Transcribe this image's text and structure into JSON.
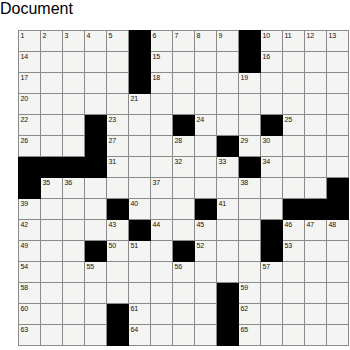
{
  "puzzle": {
    "title": "Crossword Grid",
    "rows": 15,
    "cols": 15,
    "cell_size_px": 21,
    "colors": {
      "block": "#000000",
      "cell": "#f4f4f2",
      "grid_line": "#8a8a8a",
      "number_text": "#111111",
      "page_background": "#ffffff"
    },
    "max_clue_number": 65,
    "grid": [
      [
        {
          "block": false,
          "number": "1"
        },
        {
          "block": false,
          "number": "2"
        },
        {
          "block": false,
          "number": "3"
        },
        {
          "block": false,
          "number": "4"
        },
        {
          "block": false,
          "number": "5"
        },
        {
          "block": true,
          "number": ""
        },
        {
          "block": false,
          "number": "6"
        },
        {
          "block": false,
          "number": "7"
        },
        {
          "block": false,
          "number": "8"
        },
        {
          "block": false,
          "number": "9"
        },
        {
          "block": true,
          "number": ""
        },
        {
          "block": false,
          "number": "10"
        },
        {
          "block": false,
          "number": "11"
        },
        {
          "block": false,
          "number": "12"
        },
        {
          "block": false,
          "number": "13"
        }
      ],
      [
        {
          "block": false,
          "number": "14"
        },
        {
          "block": false,
          "number": ""
        },
        {
          "block": false,
          "number": ""
        },
        {
          "block": false,
          "number": ""
        },
        {
          "block": false,
          "number": ""
        },
        {
          "block": true,
          "number": ""
        },
        {
          "block": false,
          "number": "15"
        },
        {
          "block": false,
          "number": ""
        },
        {
          "block": false,
          "number": ""
        },
        {
          "block": false,
          "number": ""
        },
        {
          "block": true,
          "number": ""
        },
        {
          "block": false,
          "number": "16"
        },
        {
          "block": false,
          "number": ""
        },
        {
          "block": false,
          "number": ""
        },
        {
          "block": false,
          "number": ""
        }
      ],
      [
        {
          "block": false,
          "number": "17"
        },
        {
          "block": false,
          "number": ""
        },
        {
          "block": false,
          "number": ""
        },
        {
          "block": false,
          "number": ""
        },
        {
          "block": false,
          "number": ""
        },
        {
          "block": true,
          "number": ""
        },
        {
          "block": false,
          "number": "18"
        },
        {
          "block": false,
          "number": ""
        },
        {
          "block": false,
          "number": ""
        },
        {
          "block": false,
          "number": ""
        },
        {
          "block": false,
          "number": "19"
        },
        {
          "block": false,
          "number": ""
        },
        {
          "block": false,
          "number": ""
        },
        {
          "block": false,
          "number": ""
        },
        {
          "block": false,
          "number": ""
        }
      ],
      [
        {
          "block": false,
          "number": "20"
        },
        {
          "block": false,
          "number": ""
        },
        {
          "block": false,
          "number": ""
        },
        {
          "block": false,
          "number": ""
        },
        {
          "block": false,
          "number": ""
        },
        {
          "block": false,
          "number": "21"
        },
        {
          "block": false,
          "number": ""
        },
        {
          "block": false,
          "number": ""
        },
        {
          "block": false,
          "number": ""
        },
        {
          "block": false,
          "number": ""
        },
        {
          "block": false,
          "number": ""
        },
        {
          "block": false,
          "number": ""
        },
        {
          "block": false,
          "number": ""
        },
        {
          "block": false,
          "number": ""
        },
        {
          "block": false,
          "number": ""
        }
      ],
      [
        {
          "block": false,
          "number": "22"
        },
        {
          "block": false,
          "number": ""
        },
        {
          "block": false,
          "number": ""
        },
        {
          "block": true,
          "number": ""
        },
        {
          "block": false,
          "number": "23"
        },
        {
          "block": false,
          "number": ""
        },
        {
          "block": false,
          "number": ""
        },
        {
          "block": true,
          "number": ""
        },
        {
          "block": false,
          "number": "24"
        },
        {
          "block": false,
          "number": ""
        },
        {
          "block": false,
          "number": ""
        },
        {
          "block": true,
          "number": ""
        },
        {
          "block": false,
          "number": "25"
        },
        {
          "block": false,
          "number": ""
        },
        {
          "block": false,
          "number": ""
        }
      ],
      [
        {
          "block": false,
          "number": "26"
        },
        {
          "block": false,
          "number": ""
        },
        {
          "block": false,
          "number": ""
        },
        {
          "block": true,
          "number": ""
        },
        {
          "block": false,
          "number": "27"
        },
        {
          "block": false,
          "number": ""
        },
        {
          "block": false,
          "number": ""
        },
        {
          "block": false,
          "number": "28"
        },
        {
          "block": false,
          "number": ""
        },
        {
          "block": true,
          "number": ""
        },
        {
          "block": false,
          "number": "29"
        },
        {
          "block": false,
          "number": "30"
        },
        {
          "block": false,
          "number": ""
        },
        {
          "block": false,
          "number": ""
        },
        {
          "block": false,
          "number": ""
        }
      ],
      [
        {
          "block": true,
          "number": ""
        },
        {
          "block": true,
          "number": ""
        },
        {
          "block": true,
          "number": ""
        },
        {
          "block": true,
          "number": ""
        },
        {
          "block": false,
          "number": "31"
        },
        {
          "block": false,
          "number": ""
        },
        {
          "block": false,
          "number": ""
        },
        {
          "block": false,
          "number": "32"
        },
        {
          "block": false,
          "number": ""
        },
        {
          "block": false,
          "number": "33"
        },
        {
          "block": true,
          "number": ""
        },
        {
          "block": false,
          "number": "34"
        },
        {
          "block": false,
          "number": ""
        },
        {
          "block": false,
          "number": ""
        },
        {
          "block": false,
          "number": ""
        }
      ],
      [
        {
          "block": true,
          "number": ""
        },
        {
          "block": false,
          "number": "35"
        },
        {
          "block": false,
          "number": "36"
        },
        {
          "block": false,
          "number": ""
        },
        {
          "block": false,
          "number": ""
        },
        {
          "block": false,
          "number": ""
        },
        {
          "block": false,
          "number": "37"
        },
        {
          "block": false,
          "number": ""
        },
        {
          "block": false,
          "number": ""
        },
        {
          "block": false,
          "number": ""
        },
        {
          "block": false,
          "number": "38"
        },
        {
          "block": false,
          "number": ""
        },
        {
          "block": false,
          "number": ""
        },
        {
          "block": false,
          "number": ""
        },
        {
          "block": true,
          "number": ""
        }
      ],
      [
        {
          "block": false,
          "number": "39"
        },
        {
          "block": false,
          "number": ""
        },
        {
          "block": false,
          "number": ""
        },
        {
          "block": false,
          "number": ""
        },
        {
          "block": true,
          "number": ""
        },
        {
          "block": false,
          "number": "40"
        },
        {
          "block": false,
          "number": ""
        },
        {
          "block": false,
          "number": ""
        },
        {
          "block": true,
          "number": ""
        },
        {
          "block": false,
          "number": "41"
        },
        {
          "block": false,
          "number": ""
        },
        {
          "block": false,
          "number": ""
        },
        {
          "block": true,
          "number": ""
        },
        {
          "block": true,
          "number": ""
        },
        {
          "block": true,
          "number": ""
        }
      ],
      [
        {
          "block": false,
          "number": "42"
        },
        {
          "block": false,
          "number": ""
        },
        {
          "block": false,
          "number": ""
        },
        {
          "block": false,
          "number": ""
        },
        {
          "block": false,
          "number": "43"
        },
        {
          "block": true,
          "number": ""
        },
        {
          "block": false,
          "number": "44"
        },
        {
          "block": false,
          "number": ""
        },
        {
          "block": false,
          "number": "45"
        },
        {
          "block": false,
          "number": ""
        },
        {
          "block": false,
          "number": ""
        },
        {
          "block": true,
          "number": ""
        },
        {
          "block": false,
          "number": "46"
        },
        {
          "block": false,
          "number": "47"
        },
        {
          "block": false,
          "number": "48"
        }
      ],
      [
        {
          "block": false,
          "number": "49"
        },
        {
          "block": false,
          "number": ""
        },
        {
          "block": false,
          "number": ""
        },
        {
          "block": true,
          "number": ""
        },
        {
          "block": false,
          "number": "50"
        },
        {
          "block": false,
          "number": "51"
        },
        {
          "block": false,
          "number": ""
        },
        {
          "block": true,
          "number": ""
        },
        {
          "block": false,
          "number": "52"
        },
        {
          "block": false,
          "number": ""
        },
        {
          "block": false,
          "number": ""
        },
        {
          "block": true,
          "number": ""
        },
        {
          "block": false,
          "number": "53"
        },
        {
          "block": false,
          "number": ""
        },
        {
          "block": false,
          "number": ""
        }
      ],
      [
        {
          "block": false,
          "number": "54"
        },
        {
          "block": false,
          "number": ""
        },
        {
          "block": false,
          "number": ""
        },
        {
          "block": false,
          "number": "55"
        },
        {
          "block": false,
          "number": ""
        },
        {
          "block": false,
          "number": ""
        },
        {
          "block": false,
          "number": ""
        },
        {
          "block": false,
          "number": "56"
        },
        {
          "block": false,
          "number": ""
        },
        {
          "block": false,
          "number": ""
        },
        {
          "block": false,
          "number": ""
        },
        {
          "block": false,
          "number": "57"
        },
        {
          "block": false,
          "number": ""
        },
        {
          "block": false,
          "number": ""
        },
        {
          "block": false,
          "number": ""
        }
      ],
      [
        {
          "block": false,
          "number": "58"
        },
        {
          "block": false,
          "number": ""
        },
        {
          "block": false,
          "number": ""
        },
        {
          "block": false,
          "number": ""
        },
        {
          "block": false,
          "number": ""
        },
        {
          "block": false,
          "number": ""
        },
        {
          "block": false,
          "number": ""
        },
        {
          "block": false,
          "number": ""
        },
        {
          "block": false,
          "number": ""
        },
        {
          "block": true,
          "number": ""
        },
        {
          "block": false,
          "number": "59"
        },
        {
          "block": false,
          "number": ""
        },
        {
          "block": false,
          "number": ""
        },
        {
          "block": false,
          "number": ""
        },
        {
          "block": false,
          "number": ""
        }
      ],
      [
        {
          "block": false,
          "number": "60"
        },
        {
          "block": false,
          "number": ""
        },
        {
          "block": false,
          "number": ""
        },
        {
          "block": false,
          "number": ""
        },
        {
          "block": true,
          "number": ""
        },
        {
          "block": false,
          "number": "61"
        },
        {
          "block": false,
          "number": ""
        },
        {
          "block": false,
          "number": ""
        },
        {
          "block": false,
          "number": ""
        },
        {
          "block": true,
          "number": ""
        },
        {
          "block": false,
          "number": "62"
        },
        {
          "block": false,
          "number": ""
        },
        {
          "block": false,
          "number": ""
        },
        {
          "block": false,
          "number": ""
        },
        {
          "block": false,
          "number": ""
        }
      ],
      [
        {
          "block": false,
          "number": "63"
        },
        {
          "block": false,
          "number": ""
        },
        {
          "block": false,
          "number": ""
        },
        {
          "block": false,
          "number": ""
        },
        {
          "block": true,
          "number": ""
        },
        {
          "block": false,
          "number": "64"
        },
        {
          "block": false,
          "number": ""
        },
        {
          "block": false,
          "number": ""
        },
        {
          "block": false,
          "number": ""
        },
        {
          "block": true,
          "number": ""
        },
        {
          "block": false,
          "number": "65"
        },
        {
          "block": false,
          "number": ""
        },
        {
          "block": false,
          "number": ""
        },
        {
          "block": false,
          "number": ""
        },
        {
          "block": false,
          "number": ""
        }
      ]
    ]
  }
}
